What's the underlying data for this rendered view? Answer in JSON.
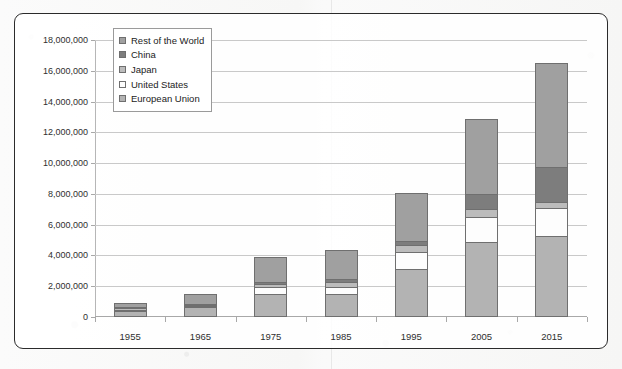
{
  "chart_data": {
    "type": "bar",
    "stacked": true,
    "title": "",
    "xlabel": "",
    "ylabel": "",
    "grid": true,
    "legend_position": "inside-top-left",
    "categories": [
      "1955",
      "1965",
      "1975",
      "1985",
      "1995",
      "2005",
      "2015"
    ],
    "ylim": [
      0,
      18000000
    ],
    "ytick_values": [
      0,
      2000000,
      4000000,
      6000000,
      8000000,
      10000000,
      12000000,
      14000000,
      16000000,
      18000000
    ],
    "ytick_labels": [
      "0",
      "2,000,000",
      "4,000,000",
      "6,000,000",
      "8,000,000",
      "10,000,000",
      "12,000,000",
      "14,000,000",
      "16,000,000",
      "18,000,000"
    ],
    "series": [
      {
        "name": "European Union",
        "color": "#b3b3b3",
        "values": [
          400000,
          620000,
          1500000,
          1520000,
          3100000,
          4900000,
          5250000
        ]
      },
      {
        "name": "United States",
        "color": "#fdfdfd",
        "values": [
          80000,
          100000,
          450000,
          450000,
          1100000,
          1600000,
          1850000
        ]
      },
      {
        "name": "Japan",
        "color": "#bcbcbc",
        "values": [
          20000,
          50000,
          200000,
          300000,
          450000,
          550000,
          400000
        ]
      },
      {
        "name": "China",
        "color": "#7d7d7d",
        "values": [
          50000,
          80000,
          120000,
          200000,
          300000,
          950000,
          2250000
        ]
      },
      {
        "name": "Rest of the World",
        "color": "#a0a0a0",
        "values": [
          300000,
          600000,
          1630000,
          1860000,
          3100000,
          4850000,
          6750000
        ]
      }
    ],
    "totals": [
      850000,
      1450000,
      3900000,
      4330000,
      8050000,
      12850000,
      16500000
    ]
  },
  "legend": {
    "items": [
      {
        "label": "Rest of the World",
        "color": "#a0a0a0"
      },
      {
        "label": "China",
        "color": "#7d7d7d"
      },
      {
        "label": "Japan",
        "color": "#bcbcbc"
      },
      {
        "label": "United States",
        "color": "#fdfdfd"
      },
      {
        "label": "European Union",
        "color": "#b3b3b3"
      }
    ]
  }
}
